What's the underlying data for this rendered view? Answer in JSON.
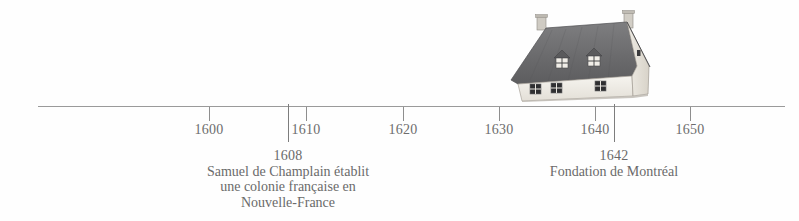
{
  "timeline": {
    "axis": {
      "start_year": 1595,
      "end_year": 1655,
      "line_color": "#9a9a9a"
    },
    "ticks": [
      {
        "year": 1600,
        "label": "1600",
        "x": 209,
        "type": "minor"
      },
      {
        "year": 1608,
        "label": "",
        "x": 288,
        "type": "event"
      },
      {
        "year": 1610,
        "label": "1610",
        "x": 306,
        "type": "minor"
      },
      {
        "year": 1620,
        "label": "1620",
        "x": 403,
        "type": "minor"
      },
      {
        "year": 1630,
        "label": "1630",
        "x": 499,
        "type": "minor"
      },
      {
        "year": 1640,
        "label": "1640",
        "x": 595,
        "type": "minor"
      },
      {
        "year": 1642,
        "label": "",
        "x": 614,
        "type": "event"
      },
      {
        "year": 1650,
        "label": "1650",
        "x": 690,
        "type": "minor"
      }
    ],
    "events": [
      {
        "year": "1608",
        "x": 288,
        "lines": [
          "Samuel de Champlain établit",
          "une colonie française en",
          "Nouvelle-France"
        ]
      },
      {
        "year": "1642",
        "x": 614,
        "lines": [
          "Fondation de Montréal"
        ]
      }
    ],
    "illustration": {
      "name": "maison-quebecoise",
      "description": "Maison traditionnelle de Nouvelle-France",
      "roof_color": "#6f6f70",
      "wall_color": "#f2efe9",
      "window_color": "#3a3a3c"
    }
  }
}
